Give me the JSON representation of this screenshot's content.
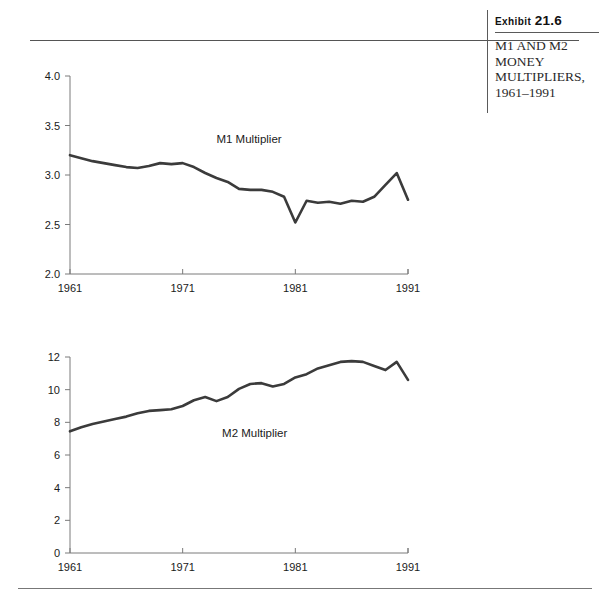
{
  "caption": {
    "exhibit_prefix": "Exhibit",
    "exhibit_number": "21.6",
    "title_line1": "M1 AND M2",
    "title_line2": "MONEY",
    "title_line3": "MULTIPLIERS,",
    "title_line4": "1961–1991"
  },
  "chart_data": [
    {
      "type": "line",
      "title": "M1 Multiplier",
      "xlabel": "",
      "ylabel": "",
      "xlim": [
        1961,
        1991
      ],
      "ylim": [
        2.0,
        4.0
      ],
      "yticks": [
        2.0,
        2.5,
        3.0,
        3.5,
        4.0
      ],
      "ytick_labels": [
        "2.0",
        "2.5",
        "3.0",
        "3.5",
        "4.0"
      ],
      "xticks": [
        1961,
        1971,
        1981,
        1991
      ],
      "xtick_labels": [
        "1961",
        "1971",
        "1981",
        "1991"
      ],
      "grid": false,
      "legend": "none",
      "annotations": [
        {
          "text": "M1 Multiplier",
          "x": 1974,
          "y": 3.32
        }
      ],
      "series": [
        {
          "name": "M1 Multiplier",
          "color": "#3b3b3b",
          "x": [
            1961,
            1962,
            1963,
            1964,
            1965,
            1966,
            1967,
            1968,
            1969,
            1970,
            1971,
            1972,
            1973,
            1974,
            1975,
            1976,
            1977,
            1978,
            1979,
            1980,
            1981,
            1982,
            1983,
            1984,
            1985,
            1986,
            1987,
            1988,
            1989,
            1990,
            1991
          ],
          "values": [
            3.2,
            3.17,
            3.14,
            3.12,
            3.1,
            3.08,
            3.07,
            3.09,
            3.12,
            3.11,
            3.12,
            3.08,
            3.02,
            2.97,
            2.93,
            2.86,
            2.85,
            2.85,
            2.83,
            2.78,
            2.52,
            2.74,
            2.72,
            2.73,
            2.71,
            2.74,
            2.73,
            2.78,
            2.9,
            3.02,
            2.75
          ]
        }
      ]
    },
    {
      "type": "line",
      "title": "M2 Multiplier",
      "xlabel": "",
      "ylabel": "",
      "xlim": [
        1961,
        1991
      ],
      "ylim": [
        0,
        12
      ],
      "yticks": [
        0,
        2,
        4,
        6,
        8,
        10,
        12
      ],
      "ytick_labels": [
        "0",
        "2",
        "4",
        "6",
        "8",
        "10",
        "12"
      ],
      "xticks": [
        1961,
        1971,
        1981,
        1991
      ],
      "xtick_labels": [
        "1961",
        "1971",
        "1981",
        "1991"
      ],
      "grid": false,
      "legend": "none",
      "annotations": [
        {
          "text": "M2 Multiplier",
          "x": 1974.5,
          "y": 7.1
        }
      ],
      "series": [
        {
          "name": "M2 Multiplier",
          "color": "#3b3b3b",
          "x": [
            1961,
            1962,
            1963,
            1964,
            1965,
            1966,
            1967,
            1968,
            1969,
            1970,
            1971,
            1972,
            1973,
            1974,
            1975,
            1976,
            1977,
            1978,
            1979,
            1980,
            1981,
            1982,
            1983,
            1984,
            1985,
            1986,
            1987,
            1988,
            1989,
            1990,
            1991
          ],
          "values": [
            7.45,
            7.7,
            7.9,
            8.05,
            8.2,
            8.35,
            8.55,
            8.7,
            8.75,
            8.8,
            9.0,
            9.35,
            9.55,
            9.3,
            9.55,
            10.05,
            10.35,
            10.4,
            10.2,
            10.35,
            10.75,
            10.95,
            11.3,
            11.5,
            11.7,
            11.75,
            11.7,
            11.45,
            11.2,
            11.7,
            10.6
          ]
        }
      ]
    }
  ]
}
